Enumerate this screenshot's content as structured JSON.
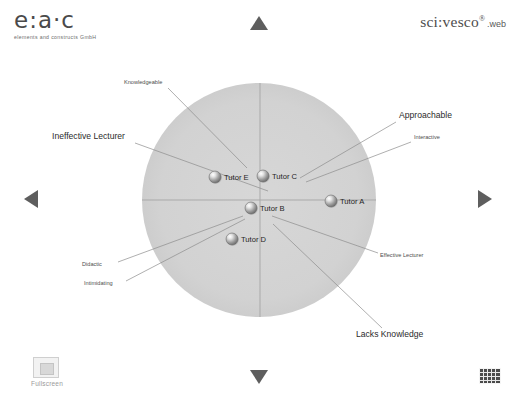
{
  "header": {
    "brand": {
      "mark": "e:a·c",
      "subtitle": "elements and constructs GmbH",
      "icon": "eac-logo"
    },
    "product": {
      "name": "sci:vesco",
      "registered": "®",
      "suffix": ".web"
    }
  },
  "navigation": {
    "up": "▲",
    "down": "▼",
    "left": "◀",
    "right": "▶"
  },
  "footer": {
    "fullscreen_label": "Fullscreen",
    "fullscreen_icon": "fullscreen-icon",
    "grid_icon": "grid-view-icon"
  },
  "chart_data": {
    "type": "scatter",
    "title": "",
    "xlabel": "",
    "ylabel": "",
    "xlim": [
      -1,
      1
    ],
    "ylim": [
      -1,
      1
    ],
    "grid": false,
    "legend": "none",
    "plot_shape": "circle",
    "axes_lines": [
      "horizontal",
      "vertical"
    ],
    "circle": {
      "cx": 259,
      "cy": 200,
      "r": 117,
      "fill": "#d4d4d4"
    },
    "points": [
      {
        "name": "Tutor A",
        "px": 331,
        "py": 201,
        "x": 0.62,
        "y": 0.0
      },
      {
        "name": "Tutor B",
        "px": 251,
        "py": 208,
        "x": -0.07,
        "y": -0.07
      },
      {
        "name": "Tutor C",
        "px": 263,
        "py": 176,
        "x": 0.03,
        "y": 0.21
      },
      {
        "name": "Tutor D",
        "px": 232,
        "py": 239,
        "x": -0.23,
        "y": -0.33
      },
      {
        "name": "Tutor E",
        "px": 215,
        "py": 177,
        "x": -0.38,
        "y": 0.2
      }
    ],
    "annotations": [
      {
        "label": "Knowledgeable",
        "size": "small",
        "tx": 124,
        "ty": 84,
        "anchor": "start",
        "lx1": 168,
        "ly1": 88,
        "lx2": 247,
        "ly2": 168
      },
      {
        "label": "Ineffective Lecturer",
        "size": "large",
        "tx": 52,
        "ty": 139,
        "anchor": "start",
        "lx1": 135,
        "ly1": 143,
        "lx2": 268,
        "ly2": 191
      },
      {
        "label": "Approachable",
        "size": "large",
        "tx": 399,
        "ty": 118,
        "anchor": "start",
        "lx1": 396,
        "ly1": 122,
        "lx2": 300,
        "ly2": 178
      },
      {
        "label": "Interactive",
        "size": "small",
        "tx": 414,
        "ty": 139,
        "anchor": "start",
        "lx1": 411,
        "ly1": 142,
        "lx2": 306,
        "ly2": 182
      },
      {
        "label": "Didactic",
        "size": "small",
        "tx": 82,
        "ty": 266,
        "anchor": "start",
        "lx1": 118,
        "ly1": 262,
        "lx2": 243,
        "ly2": 216
      },
      {
        "label": "Intimidating",
        "size": "small",
        "tx": 84,
        "ty": 285,
        "anchor": "start",
        "lx1": 126,
        "ly1": 281,
        "lx2": 245,
        "ly2": 219
      },
      {
        "label": "Effective Lecturer",
        "size": "small",
        "tx": 380,
        "ty": 257,
        "anchor": "start",
        "lx1": 378,
        "ly1": 253,
        "lx2": 272,
        "ly2": 216
      },
      {
        "label": "Lacks Knowledge",
        "size": "large",
        "tx": 356,
        "ty": 337,
        "anchor": "start",
        "lx1": 382,
        "ly1": 328,
        "lx2": 273,
        "ly2": 224
      }
    ]
  }
}
